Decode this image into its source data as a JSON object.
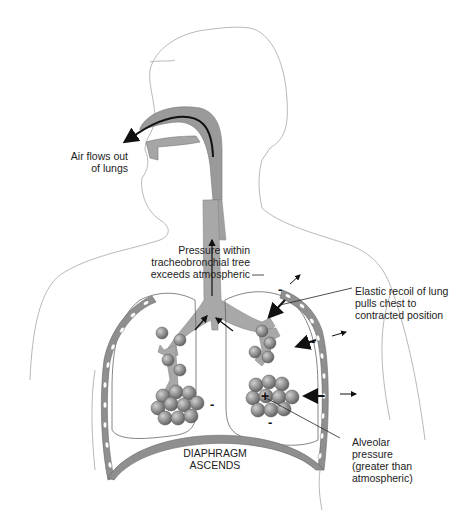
{
  "diagram": {
    "labels": {
      "air_flow": [
        "Air flows out",
        "of lungs"
      ],
      "pressure_tree": [
        "Pressure within",
        "tracheobronchial tree",
        "exceeds atmospheric"
      ],
      "elastic_recoil": [
        "Elastic recoil of lung",
        "pulls chest to",
        "contracted position"
      ],
      "diaphragm": [
        "DIAPHRAGM",
        "ASCENDS"
      ],
      "alveolar": [
        "Alveolar",
        "pressure",
        "(greater than",
        "atmospheric)"
      ]
    },
    "signs": {
      "minus": "-",
      "plus": "+"
    },
    "colors": {
      "airway_fill": "#a8a8a8",
      "tissue_fill": "#8f8f8f",
      "outline": "#b5b5b5",
      "arrow": "#111111",
      "alveoli": "#8a8a8a"
    }
  }
}
